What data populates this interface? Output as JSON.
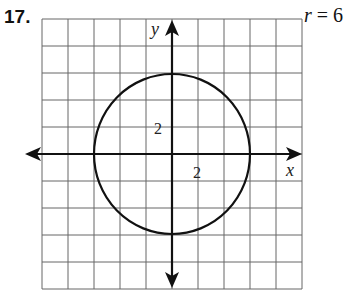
{
  "problem": {
    "number": "17.",
    "equation_var": "r",
    "equation_rest": " = 6"
  },
  "graph": {
    "x_axis_label": "x",
    "y_axis_label": "y",
    "x_tick_label": "2",
    "y_tick_label": "2",
    "grid_cols": 10,
    "grid_rows": 10,
    "unit_per_cell": 1,
    "circle": {
      "center": [
        0,
        0
      ],
      "radius": 3
    },
    "colors": {
      "grid": "#555555",
      "axis": "#111111",
      "curve": "#111111"
    }
  }
}
